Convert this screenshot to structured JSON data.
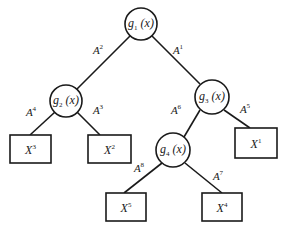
{
  "diagram": {
    "type": "decision-tree",
    "colors": {
      "stroke": "#1a1a1a",
      "background": "#ffffff"
    },
    "nodes": [
      {
        "id": "g1",
        "base": "g",
        "sub": "1",
        "arg": "(x)",
        "cx": 141,
        "cy": 24,
        "r": 16
      },
      {
        "id": "g2",
        "base": "g",
        "sub": "2",
        "arg": "(x)",
        "cx": 66,
        "cy": 101,
        "r": 16
      },
      {
        "id": "g3",
        "base": "g",
        "sub": "3",
        "arg": "(x)",
        "cx": 212,
        "cy": 97,
        "r": 17
      },
      {
        "id": "g4",
        "base": "g",
        "sub": "4",
        "arg": "(x)",
        "cx": 173,
        "cy": 150,
        "r": 17
      }
    ],
    "leaves": [
      {
        "id": "X3",
        "base": "X",
        "sup": "3",
        "x": 10,
        "y": 135,
        "w": 41,
        "h": 28
      },
      {
        "id": "X2",
        "base": "X",
        "sup": "2",
        "x": 88,
        "y": 135,
        "w": 43,
        "h": 28
      },
      {
        "id": "X1",
        "base": "X",
        "sup": "1",
        "x": 235,
        "y": 128,
        "w": 42,
        "h": 30
      },
      {
        "id": "X5",
        "base": "X",
        "sup": "5",
        "x": 106,
        "y": 193,
        "w": 40,
        "h": 28
      },
      {
        "id": "X4",
        "base": "X",
        "sup": "4",
        "x": 202,
        "y": 193,
        "w": 40,
        "h": 28
      }
    ],
    "edges": [
      {
        "from": "g1",
        "to": "g2",
        "label_base": "A",
        "label_sup": "2",
        "x1": 130,
        "y1": 36,
        "x2": 77,
        "y2": 89,
        "lx": 98,
        "ly": 50
      },
      {
        "from": "g1",
        "to": "g3",
        "label_base": "A",
        "label_sup": "1",
        "x1": 152,
        "y1": 36,
        "x2": 200,
        "y2": 84,
        "lx": 178,
        "ly": 50
      },
      {
        "from": "g2",
        "to": "X3",
        "label_base": "A",
        "label_sup": "4",
        "x1": 55,
        "y1": 112,
        "x2": 30,
        "y2": 135,
        "lx": 31,
        "ly": 112
      },
      {
        "from": "g2",
        "to": "X2",
        "label_base": "A",
        "label_sup": "3",
        "x1": 77,
        "y1": 112,
        "x2": 100,
        "y2": 135,
        "lx": 98,
        "ly": 110
      },
      {
        "from": "g3",
        "to": "g4",
        "label_base": "A",
        "label_sup": "6",
        "x1": 200,
        "y1": 110,
        "x2": 184,
        "y2": 137,
        "lx": 176,
        "ly": 110
      },
      {
        "from": "g3",
        "to": "X1",
        "label_base": "A",
        "label_sup": "5",
        "x1": 224,
        "y1": 110,
        "x2": 250,
        "y2": 128,
        "lx": 245,
        "ly": 109
      },
      {
        "from": "g4",
        "to": "X5",
        "label_base": "A",
        "label_sup": "8",
        "x1": 162,
        "y1": 163,
        "x2": 124,
        "y2": 193,
        "lx": 139,
        "ly": 168
      },
      {
        "from": "g4",
        "to": "X4",
        "label_base": "A",
        "label_sup": "7",
        "x1": 185,
        "y1": 163,
        "x2": 222,
        "y2": 193,
        "lx": 218,
        "ly": 176
      }
    ]
  }
}
